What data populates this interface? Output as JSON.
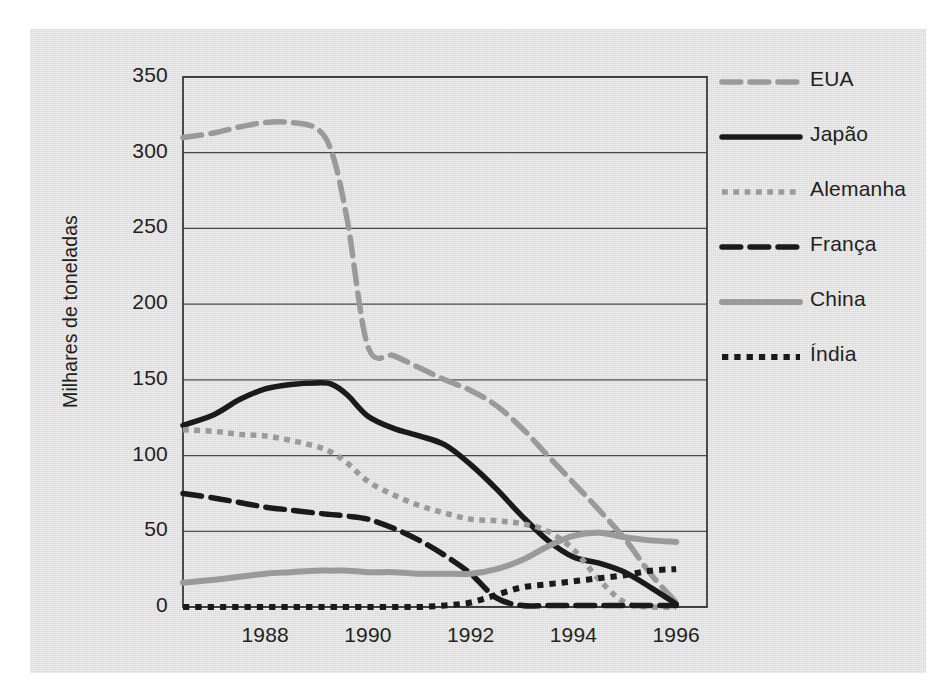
{
  "chart_data": {
    "type": "line",
    "title": "",
    "subtitle": "",
    "xlabel": "",
    "ylabel": "Milhares de toneladas",
    "xlim": [
      1986.4,
      1996.6
    ],
    "ylim": [
      0,
      350
    ],
    "yticks": [
      0,
      50,
      100,
      150,
      200,
      250,
      300,
      350
    ],
    "ytick_labels": [
      "0",
      "50",
      "100",
      "150",
      "200",
      "250",
      "300",
      "350"
    ],
    "xticks": [
      1988,
      1990,
      1992,
      1994,
      1996
    ],
    "xtick_labels": [
      "1988",
      "1990",
      "1992",
      "1994",
      "1996"
    ],
    "grid": "horizontal",
    "legend_position": "right",
    "x": [
      1986.4,
      1987,
      1987.5,
      1988,
      1988.5,
      1989,
      1989.3,
      1989.6,
      1990,
      1990.5,
      1991,
      1991.5,
      1992,
      1992.5,
      1993,
      1993.5,
      1994,
      1994.5,
      1995,
      1995.5,
      1996
    ],
    "series": [
      {
        "name": "EUA",
        "color": "#9a9a9a",
        "style": "dashed",
        "width": 5.5,
        "values": [
          310,
          313,
          317,
          320,
          320,
          316,
          300,
          255,
          172,
          166,
          158,
          150,
          143,
          133,
          118,
          100,
          82,
          64,
          45,
          22,
          3
        ]
      },
      {
        "name": "Japão",
        "color": "#1a1a1a",
        "style": "solid",
        "width": 5.5,
        "values": [
          120,
          127,
          137,
          144,
          147,
          148,
          147,
          140,
          126,
          118,
          113,
          107,
          94,
          78,
          60,
          44,
          33,
          29,
          23,
          13,
          2
        ]
      },
      {
        "name": "Alemanha",
        "color": "#9a9a9a",
        "style": "dotted",
        "width": 5.5,
        "values": [
          117,
          116,
          114,
          113,
          110,
          106,
          102,
          95,
          83,
          74,
          67,
          62,
          58,
          57,
          55,
          50,
          38,
          18,
          3,
          0,
          0
        ]
      },
      {
        "name": "França",
        "color": "#1a1a1a",
        "style": "dashed",
        "width": 5.5,
        "values": [
          75,
          72,
          69,
          66,
          64,
          62,
          61,
          60,
          58,
          52,
          44,
          34,
          22,
          6,
          1,
          1,
          1,
          1,
          1,
          1,
          1
        ]
      },
      {
        "name": "China",
        "color": "#9a9a9a",
        "style": "solid",
        "width": 6.0,
        "values": [
          16,
          18,
          20,
          22,
          23,
          24,
          24,
          24,
          23,
          23,
          22,
          22,
          22,
          25,
          31,
          40,
          47,
          49,
          46,
          44,
          43
        ]
      },
      {
        "name": "Índia",
        "color": "#1a1a1a",
        "style": "dotted",
        "width": 6.0,
        "values": [
          0,
          0,
          0,
          0,
          0,
          0,
          0,
          0,
          0,
          0,
          0,
          1,
          3,
          8,
          13,
          15,
          17,
          19,
          21,
          24,
          25
        ]
      }
    ]
  },
  "axes": {
    "ylabel": "Milhares de toneladas",
    "ytick_labels": [
      "350",
      "300",
      "250",
      "200",
      "150",
      "100",
      "50",
      "0"
    ],
    "xtick_labels": [
      "1988",
      "1990",
      "1992",
      "1994",
      "1996"
    ]
  },
  "legend": {
    "items": [
      {
        "label": "EUA",
        "color": "#9a9a9a",
        "style": "dashed"
      },
      {
        "label": "Japão",
        "color": "#1a1a1a",
        "style": "solid"
      },
      {
        "label": "Alemanha",
        "color": "#9a9a9a",
        "style": "dotted"
      },
      {
        "label": "França",
        "color": "#1a1a1a",
        "style": "dashed"
      },
      {
        "label": "China",
        "color": "#9a9a9a",
        "style": "solid"
      },
      {
        "label": "Índia",
        "color": "#1a1a1a",
        "style": "dotted"
      }
    ]
  },
  "colors": {
    "panel_background": "#e0e0e0",
    "page_background": "#ffffff",
    "axis": "#3a3a3a",
    "gridline": "#4a4a4a",
    "text": "#231f20",
    "gray_series": "#9a9a9a",
    "black_series": "#1a1a1a"
  }
}
